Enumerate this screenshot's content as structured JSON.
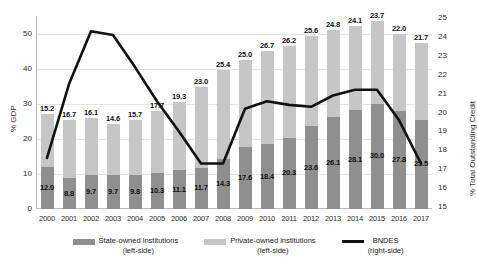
{
  "chart_data": {
    "type": "bar",
    "title": "",
    "subtitle": "",
    "xlabel": "",
    "ylabel": "% GDP",
    "ylabel_secondary": "% Total Outstanding Credit",
    "grid": true,
    "legend_position": "bottom",
    "categories": [
      "2000",
      "2001",
      "2002",
      "2003",
      "2004",
      "2005",
      "2006",
      "2007",
      "2008",
      "2009",
      "2010",
      "2011",
      "2012",
      "2013",
      "2014",
      "2015",
      "2016",
      "2017"
    ],
    "ylim": [
      0,
      55
    ],
    "yticks": [
      "0",
      "10",
      "20",
      "30",
      "40",
      "50"
    ],
    "ylim_secondary": [
      15,
      25
    ],
    "yticks_secondary": [
      "15",
      "16",
      "17",
      "18",
      "19",
      "20",
      "21",
      "22",
      "23",
      "24",
      "25"
    ],
    "series": [
      {
        "name": "State-owned institutions",
        "axis": "left",
        "kind": "bar-stack-bottom",
        "color": "#8f8f8f",
        "values": [
          12.0,
          8.8,
          9.7,
          9.7,
          9.8,
          10.3,
          11.1,
          11.7,
          14.3,
          17.6,
          18.4,
          20.3,
          23.6,
          26.1,
          28.1,
          30.0,
          27.8,
          25.5
        ],
        "labels": [
          "12.0",
          "8.8",
          "9.7",
          "9.7",
          "9.8",
          "10.3",
          "11.1",
          "11.7",
          "14.3",
          "17.6",
          "18.4",
          "20.3",
          "23.6",
          "26.1",
          "28.1",
          "30.0",
          "27.8",
          "25.5"
        ]
      },
      {
        "name": "Private-owned institutions",
        "axis": "left",
        "kind": "bar-stack-top",
        "color": "#c6c6c6",
        "values": [
          15.2,
          16.7,
          16.1,
          14.6,
          15.7,
          17.7,
          19.3,
          23.0,
          25.4,
          25.0,
          26.7,
          26.2,
          25.6,
          24.8,
          24.1,
          23.7,
          22.0,
          21.7
        ],
        "labels": [
          "15.2",
          "16.7",
          "16.1",
          "14.6",
          "15.7",
          "17.7",
          "19.3",
          "23.0",
          "25.4",
          "25.0",
          "26.7",
          "26.2",
          "25.6",
          "24.8",
          "24.1",
          "23.7",
          "22.0",
          "21.7"
        ]
      },
      {
        "name": "BNDES",
        "axis": "right",
        "kind": "line",
        "color": "#111111",
        "values": [
          17.6,
          21.5,
          24.3,
          24.1,
          22.4,
          20.6,
          19.0,
          17.3,
          17.3,
          20.2,
          20.6,
          20.4,
          20.3,
          20.9,
          21.2,
          21.2,
          19.6,
          17.3
        ]
      }
    ],
    "legend": [
      {
        "name": "State-owned institutions",
        "sub": "(left-side)",
        "marker": "bar",
        "color": "#8f8f8f"
      },
      {
        "name": "Private-owned institutions",
        "sub": "(left-side)",
        "marker": "bar",
        "color": "#c6c6c6"
      },
      {
        "name": "BNDES",
        "sub": "(right-side)",
        "marker": "line",
        "color": "#111111"
      }
    ]
  }
}
